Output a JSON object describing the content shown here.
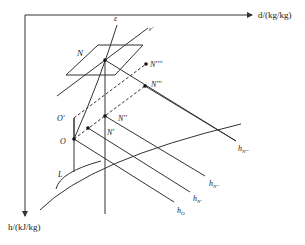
{
  "diagram": {
    "axes": {
      "x_label": "d/(kg/kg)",
      "y_label": "h/(kJ/kg)"
    },
    "lines": {
      "epsilon": "ε",
      "epsilon_prime": "ε'"
    },
    "points": {
      "N": "N",
      "N_prime": "N'",
      "N_double": "N''",
      "N_triple": "N'''",
      "N_quad": "N''''",
      "O": "O",
      "O_prime": "O'",
      "L": "L"
    },
    "enthalpy_lines": {
      "h_O": "h",
      "h_O_sub": "O",
      "h_N1": "h",
      "h_N1_sub": "N'",
      "h_N2": "h",
      "h_N2_sub": "N''",
      "h_N3": "h",
      "h_N3_sub": "N'''"
    },
    "colors": {
      "line": "#333333",
      "background": "#ffffff"
    }
  }
}
